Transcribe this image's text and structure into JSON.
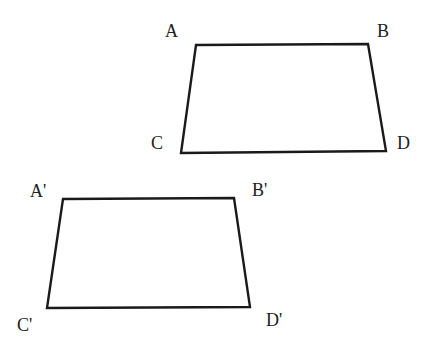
{
  "diagram": {
    "stroke_color": "#1a1a1a",
    "label_color": "#222222",
    "shapes": [
      {
        "name": "quadrilateral-abcd",
        "points": "196,45 368,44 386,151 181,153",
        "labels": [
          {
            "text": "A",
            "x": 165,
            "y": 37
          },
          {
            "text": "B",
            "x": 377,
            "y": 37
          },
          {
            "text": "C",
            "x": 151,
            "y": 149
          },
          {
            "text": "D",
            "x": 397,
            "y": 149
          }
        ]
      },
      {
        "name": "quadrilateral-abcd-prime",
        "points": "63,199 234,198 250,307 47,308",
        "labels": [
          {
            "text": "A'",
            "x": 30,
            "y": 197
          },
          {
            "text": "B'",
            "x": 252,
            "y": 196
          },
          {
            "text": "C'",
            "x": 17,
            "y": 331
          },
          {
            "text": "D'",
            "x": 266,
            "y": 326
          }
        ]
      }
    ]
  }
}
